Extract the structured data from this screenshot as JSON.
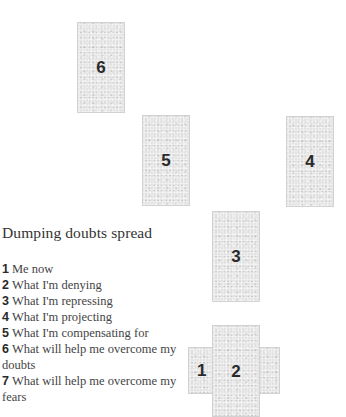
{
  "spread": {
    "title": "Dumping doubts spread",
    "cards": [
      {
        "id": "6",
        "label": "6",
        "orientation": "vertical"
      },
      {
        "id": "5",
        "label": "5",
        "orientation": "vertical"
      },
      {
        "id": "4",
        "label": "4",
        "orientation": "vertical"
      },
      {
        "id": "3",
        "label": "3",
        "orientation": "vertical"
      },
      {
        "id": "1",
        "label": "1",
        "orientation": "horizontal"
      },
      {
        "id": "2",
        "label": "2",
        "orientation": "vertical"
      }
    ],
    "positions": [
      {
        "number": "1",
        "meaning": "Me now"
      },
      {
        "number": "2",
        "meaning": "What I'm denying"
      },
      {
        "number": "3",
        "meaning": "What I'm repressing"
      },
      {
        "number": "4",
        "meaning": "What I'm projecting"
      },
      {
        "number": "5",
        "meaning": "What I'm compensating for"
      },
      {
        "number": "6",
        "meaning": "What will help me overcome my doubts"
      },
      {
        "number": "7",
        "meaning": "What will help me overcome my fears"
      }
    ]
  },
  "colors": {
    "card_fill": "#e4e4e4",
    "card_border": "#d2d2d2",
    "text": "#444444",
    "background": "#ffffff"
  }
}
